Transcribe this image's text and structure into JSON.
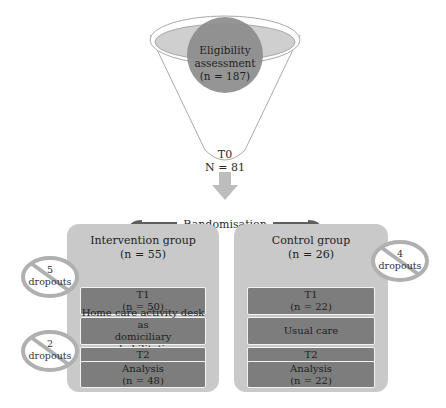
{
  "funnel": {
    "eligibility": {
      "line1": "Eligibility",
      "line2": "assessment",
      "line3": "(n = 187)"
    },
    "t0": {
      "label": "T0",
      "count": "N = 81"
    }
  },
  "randomisation": {
    "label": "Randomisation"
  },
  "intervention": {
    "title": "Intervention group",
    "n": "(n = 55)",
    "steps": [
      {
        "line1": "T1",
        "line2": "(n = 50)"
      },
      {
        "line1": "Home care activity desk as",
        "line2": "domiciliary rehabilitation"
      },
      {
        "line1": "T2",
        "line2": "(n = 48)"
      },
      {
        "line1": "Analysis",
        "line2": "(n = 48)"
      }
    ],
    "dropouts": [
      {
        "count": "5",
        "label": "dropouts"
      },
      {
        "count": "2",
        "label": "dropouts"
      }
    ]
  },
  "control": {
    "title": "Control group",
    "n": "(n = 26)",
    "steps": [
      {
        "line1": "T1",
        "line2": "(n = 22)"
      },
      {
        "line1": "Usual care"
      },
      {
        "line1": "T2",
        "line2": "(n = 22)"
      },
      {
        "line1": "Analysis",
        "line2": "(n = 22)"
      }
    ],
    "dropouts": [
      {
        "count": "4",
        "label": "dropouts"
      }
    ]
  },
  "colors": {
    "funnel_ellipse": "#c8c8c8",
    "circle": "#8a8a8a",
    "arrow_light": "#bdbdbd",
    "arrow_dark": "#5e5e5e",
    "group_bg": "#c9c9c9",
    "step_bg": "#7d7d7d"
  }
}
